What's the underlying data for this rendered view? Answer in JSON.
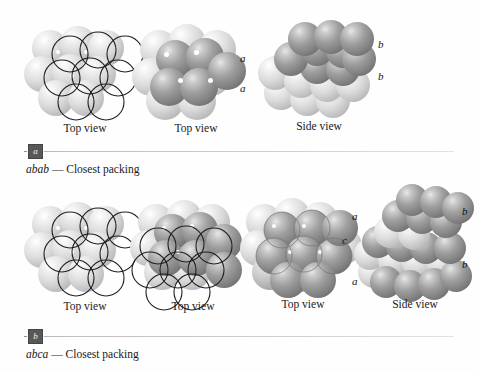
{
  "figure": {
    "background_color": "#fefefe",
    "sphere_colors": {
      "light_layer": "#dcdcdc",
      "dark_layer": "#8a8a8a",
      "outline": "#1f1f1f"
    },
    "rule_color": "#c6c6c6",
    "badge_color": "#57585a"
  },
  "sections": [
    {
      "badge": "a",
      "caption_italic": "abab",
      "caption_dash": " — ",
      "caption_rest": "Closest packing",
      "panels": [
        {
          "label": "Top view",
          "kind": "top-outline"
        },
        {
          "label": "Top view",
          "kind": "top-two-layer"
        },
        {
          "label": "Side view",
          "kind": "side-abab"
        }
      ],
      "layer_labels_left": [
        "a",
        "a"
      ],
      "layer_labels_right": [
        "b",
        "b"
      ]
    },
    {
      "badge": "b",
      "caption_italic": "abca",
      "caption_dash": " — ",
      "caption_rest": "Closest packing",
      "panels": [
        {
          "label": "Top view",
          "kind": "top-outline"
        },
        {
          "label": "Top view",
          "kind": "top-two-layer-outline"
        },
        {
          "label": "Top view",
          "kind": "top-three-layer"
        },
        {
          "label": "Side view",
          "kind": "side-abca"
        }
      ],
      "layer_labels_left": [
        "a",
        "c",
        "a"
      ],
      "layer_labels_right": [
        "b",
        "b"
      ]
    }
  ]
}
